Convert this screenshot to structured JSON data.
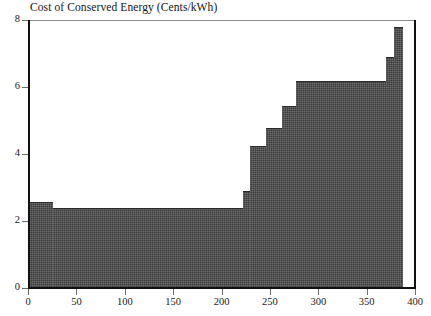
{
  "chart_data": {
    "type": "bar",
    "title": "Cost of Conserved Energy (Cents/kWh)",
    "xlabel": "",
    "ylabel": "",
    "xlim": [
      0,
      400
    ],
    "ylim": [
      0,
      8
    ],
    "grid": false,
    "legend": null,
    "y_ticks": [
      0,
      2,
      4,
      6,
      8
    ],
    "x_ticks": [
      0,
      50,
      100,
      150,
      200,
      250,
      300,
      350,
      400
    ],
    "fill_color": "#3b3b3b",
    "steps": [
      {
        "x_start": 0,
        "x_end": 26,
        "value": 2.58
      },
      {
        "x_start": 26,
        "x_end": 222,
        "value": 2.4
      },
      {
        "x_start": 222,
        "x_end": 229,
        "value": 2.9
      },
      {
        "x_start": 229,
        "x_end": 246,
        "value": 4.25
      },
      {
        "x_start": 246,
        "x_end": 263,
        "value": 4.78
      },
      {
        "x_start": 263,
        "x_end": 277,
        "value": 5.42
      },
      {
        "x_start": 277,
        "x_end": 370,
        "value": 6.18
      },
      {
        "x_start": 370,
        "x_end": 378,
        "value": 6.9
      },
      {
        "x_start": 378,
        "x_end": 388,
        "value": 7.8
      }
    ]
  }
}
